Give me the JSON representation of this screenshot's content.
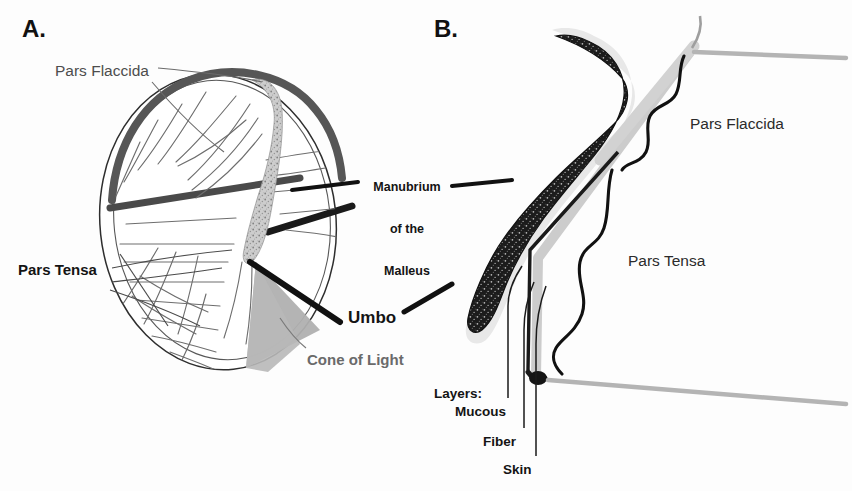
{
  "figure": {
    "background_color": "#fdfdfd"
  },
  "palette": {
    "ink_black": "#141414",
    "label_gray": "#4d4d4d",
    "rim_dark_gray": "#585858",
    "cone_of_light_gray": "#b0b0b0",
    "malleus_stipple_dark": "#1c1c1c",
    "canal_wall_gray": "#c9c9c9",
    "fiber_line_gray": "#6e6e6e",
    "paper_white": "#ffffff"
  },
  "panels": [
    {
      "id": "panel-a",
      "letter": "A.",
      "view": "otoscopic frontal view of right tympanic membrane",
      "labels": [
        {
          "id": "pars-flaccida-a",
          "text": "Pars Flaccida",
          "style": "plain",
          "x": 55,
          "y": 62
        },
        {
          "id": "pars-tensa-a",
          "text": "Pars Tensa",
          "style": "bold",
          "x": 18,
          "y": 262
        },
        {
          "id": "cone-of-light-a",
          "text": "Cone of Light",
          "style": "gray-bold",
          "x": 307,
          "y": 352
        }
      ],
      "features": [
        "oval membrane outline",
        "thick dark superior rim marking pars flaccida",
        "radial fiber striations across pars tensa",
        "stippled vertical manubrium band",
        "gray triangular cone of light in antero-inferior quadrant"
      ]
    },
    {
      "id": "panel-b",
      "letter": "B.",
      "view": "sagittal cross-section through the tympanic membrane and malleus",
      "labels": [
        {
          "id": "pars-flaccida-b",
          "text": "Pars Flaccida",
          "style": "plain-dark",
          "x": 690,
          "y": 115
        },
        {
          "id": "pars-tensa-b",
          "text": "Pars Tensa",
          "style": "plain-dark",
          "x": 628,
          "y": 252
        },
        {
          "id": "layers-heading",
          "text": "Layers:",
          "style": "layers",
          "x": 434,
          "y": 386
        },
        {
          "id": "layer-mucous",
          "text": "Mucous",
          "style": "layers",
          "x": 455,
          "y": 404
        },
        {
          "id": "layer-fiber",
          "text": "Fiber",
          "style": "layers",
          "x": 483,
          "y": 434
        },
        {
          "id": "layer-skin",
          "text": "Skin",
          "style": "layers",
          "x": 503,
          "y": 462
        }
      ],
      "features": [
        "dark stippled malleus head and manubrium in profile",
        "pale gray membrane band running infero-laterally",
        "curly brace bracketing pars flaccida extent",
        "curly brace bracketing pars tensa extent",
        "gray ear canal walls extending to the right",
        "three-layer leader lines for mucous, fiber and skin"
      ]
    }
  ],
  "shared_labels": [
    {
      "id": "manubrium-of-the-malleus",
      "lines": [
        "Manubrium",
        "of the",
        "Malleus"
      ],
      "style": "bold-small",
      "x": 364,
      "y": 152,
      "points_to": [
        "panel-a manubrium band",
        "panel-b manubrium profile"
      ]
    },
    {
      "id": "umbo",
      "text": "Umbo",
      "style": "bold",
      "x": 348,
      "y": 308,
      "points_to": [
        "panel-a umbo apex"
      ]
    }
  ],
  "leader_lines": {
    "thin_gray": 8,
    "thick_black": 3,
    "vertical_layer_lines": 3
  }
}
